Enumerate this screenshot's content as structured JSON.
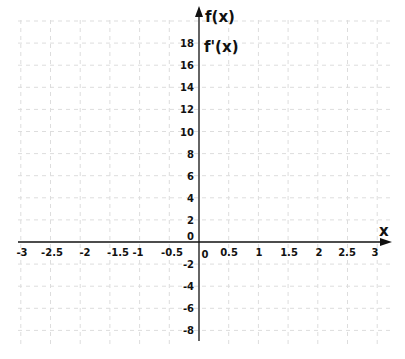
{
  "chart_data": {
    "type": "line",
    "title": "",
    "xlabel": "x",
    "ylabel_lines": [
      "f(x)",
      "f'(x)"
    ],
    "xlim": [
      -3,
      3
    ],
    "ylim": [
      -8,
      18
    ],
    "grid": true,
    "grid_style": "dashed",
    "x_ticks": [
      "-3",
      "-2.5",
      "-2",
      "-1.5",
      "-1",
      "-0.5",
      "0",
      "0.5",
      "1",
      "1.5",
      "2",
      "2.5",
      "3"
    ],
    "y_ticks": [
      "18",
      "16",
      "14",
      "12",
      "10",
      "8",
      "6",
      "4",
      "2",
      "0",
      "-2",
      "-4",
      "-6",
      "-8"
    ],
    "series": []
  },
  "colors": {
    "axis": "#111111",
    "grid": "#dddddd",
    "background": "#ffffff"
  }
}
